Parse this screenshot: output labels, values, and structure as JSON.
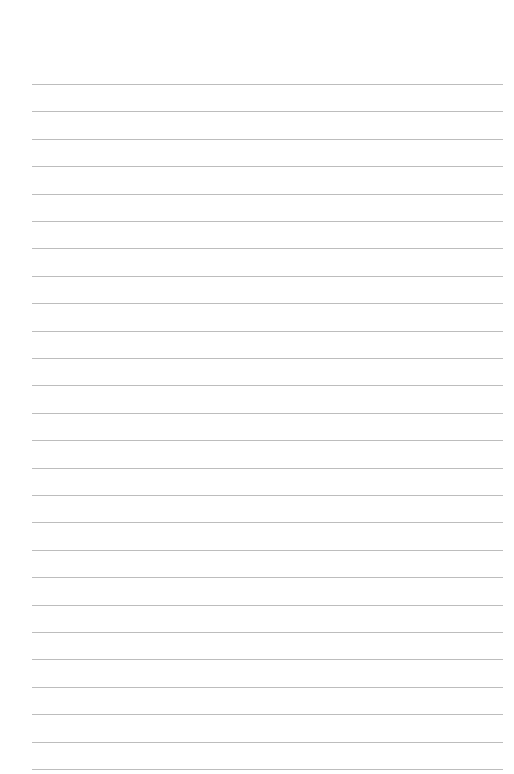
{
  "page": {
    "type": "lined-paper",
    "line_count": 26,
    "first_line_y": 84,
    "line_spacing": 27.4,
    "line_left": 32,
    "line_right": 503,
    "line_color": "#bdbdbd",
    "background_color": "#ffffff"
  }
}
